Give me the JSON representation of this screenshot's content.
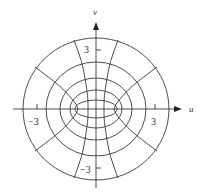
{
  "figure": {
    "type": "elliptic-coordinate-grid",
    "axes": {
      "x_label": "u",
      "y_label": "v",
      "x_ticks": [
        {
          "value": -3,
          "label": "−3"
        },
        {
          "value": 3,
          "label": "3"
        }
      ],
      "y_ticks": [
        {
          "value": 3,
          "label": "3"
        },
        {
          "value": -3,
          "label": "−3"
        }
      ]
    },
    "geometry": {
      "center": [
        96,
        109
      ],
      "ellipses": [
        {
          "rx": 73,
          "ry": 71
        },
        {
          "rx": 50,
          "ry": 47
        },
        {
          "rx": 36,
          "ry": 31
        },
        {
          "rx": 26,
          "ry": 19
        },
        {
          "rx": 21,
          "ry": 9
        }
      ],
      "hyperbola_curves": [
        [
          [
            74,
            40
          ],
          [
            82,
            62
          ],
          [
            85,
            78
          ],
          [
            87,
            91
          ],
          [
            88,
            100
          ],
          [
            88,
            109
          ]
        ],
        [
          [
            35,
            67
          ],
          [
            55,
            82
          ],
          [
            65,
            91
          ],
          [
            72,
            99
          ],
          [
            76,
            104
          ],
          [
            78,
            109
          ]
        ]
      ],
      "x_axis": {
        "from": 13,
        "to": 182
      },
      "y_axis": {
        "from": 188,
        "to": 22
      },
      "tick_px_per_3": 59
    },
    "colors": {
      "line": "#3a3a3a",
      "text": "#2a2a2a"
    }
  }
}
